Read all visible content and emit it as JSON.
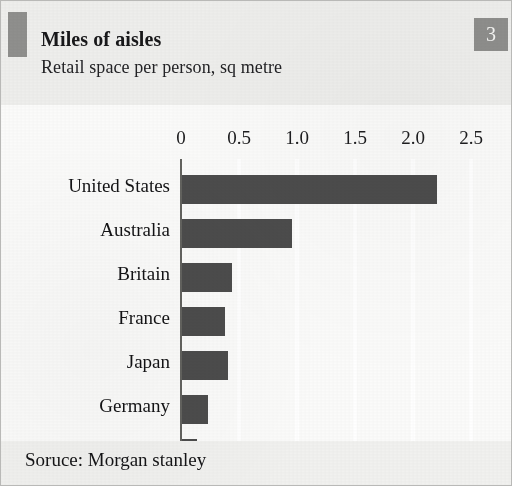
{
  "header": {
    "title": "Miles of aisles",
    "subtitle": "Retail space per person, sq metre",
    "badge": "3"
  },
  "footer": {
    "source": "Soruce: Morgan stanley"
  },
  "colors": {
    "bar": "#4c4c4c",
    "badge": "#8e8e8c",
    "rule": "#8f8f8d",
    "page": "#f2f2f1",
    "plot": "#fbfbfa",
    "gridline": "#ffffff"
  },
  "chart_data": {
    "type": "bar",
    "orientation": "horizontal",
    "title": "Miles of aisles",
    "subtitle": "Retail space per person, sq metre",
    "xlabel": "",
    "ylabel": "",
    "xlim": [
      0,
      2.75
    ],
    "xticks": [
      0,
      0.5,
      1.0,
      1.5,
      2.0,
      2.5
    ],
    "xticklabels": [
      "0",
      "0.5",
      "1.0",
      "1.5",
      "2.0",
      "2.5"
    ],
    "grid": "vertical-white-gridlines",
    "legend": "none",
    "categories": [
      "United States",
      "Australia",
      "Britain",
      "France",
      "Japan",
      "Germany",
      "Mexico"
    ],
    "values": [
      2.2,
      0.95,
      0.43,
      0.37,
      0.4,
      0.22,
      0.13
    ],
    "source": "Soruce: Morgan stanley",
    "units": "sq metre per person"
  }
}
